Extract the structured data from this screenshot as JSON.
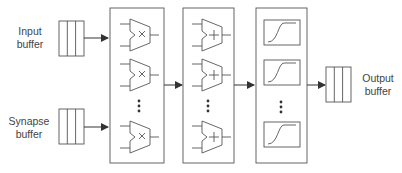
{
  "labels": {
    "input_buffer": [
      "Input",
      "buffer"
    ],
    "synapse_buffer": [
      "Synapse",
      "buffer"
    ],
    "output_buffer": [
      "Output",
      "buffer"
    ]
  },
  "stages": [
    {
      "name": "multiplier-array",
      "unit_symbol": "×",
      "units_shown": 3,
      "ellipsis": true
    },
    {
      "name": "adder-array",
      "unit_symbol": "+",
      "units_shown": 3,
      "ellipsis": true
    },
    {
      "name": "activation-array",
      "unit_symbol": "sigmoid",
      "units_shown": 3,
      "ellipsis": true
    }
  ],
  "colors": {
    "stroke": "#555555",
    "arrow": "#333333",
    "text": "#444444"
  }
}
